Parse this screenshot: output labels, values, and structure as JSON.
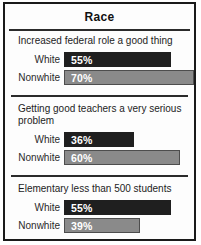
{
  "chart_data": {
    "type": "bar",
    "orientation": "horizontal",
    "title": "Race",
    "xlabel": "",
    "ylabel": "",
    "xlim": [
      0,
      100
    ],
    "value_suffix": "%",
    "grid": false,
    "legend": "none",
    "colors": {
      "white_bar": "#1f1f1f",
      "nonwhite_bar": "#8a8a8a",
      "nonwhite_bar_border": "#4d4d4d",
      "frame_border": "#1a1a1a"
    },
    "groups": [
      {
        "subtitle": "Increased federal role a good thing",
        "rows": [
          {
            "category": "White",
            "value": 55,
            "display": "55%"
          },
          {
            "category": "Nonwhite",
            "value": 70,
            "display": "70%"
          }
        ]
      },
      {
        "subtitle": "Getting good teachers a very serious problem",
        "rows": [
          {
            "category": "White",
            "value": 36,
            "display": "36%"
          },
          {
            "category": "Nonwhite",
            "value": 60,
            "display": "60%"
          }
        ]
      },
      {
        "subtitle": "Elementary less than 500 students",
        "rows": [
          {
            "category": "White",
            "value": 55,
            "display": "55%"
          },
          {
            "category": "Nonwhite",
            "value": 39,
            "display": "39%"
          }
        ]
      }
    ]
  }
}
